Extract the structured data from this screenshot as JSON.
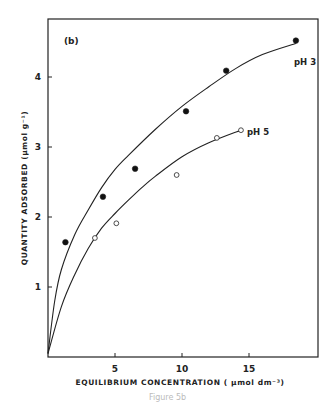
{
  "chart_data": {
    "type": "scatter",
    "panel_label": "(b)",
    "title": "",
    "xlabel": "EQUILIBRIUM CONCENTRATION ( µmol dm⁻³)",
    "ylabel": "QUANTITY ADSORBED (µmol g⁻¹)",
    "xlim": [
      0,
      20
    ],
    "ylim": [
      0,
      4.85
    ],
    "xticks": [
      5,
      10,
      15
    ],
    "yticks": [
      1,
      2,
      3,
      4
    ],
    "grid": false,
    "legend": "inline labels at curve ends",
    "series": [
      {
        "name": "pH 3",
        "marker": "filled-circle",
        "points": [
          [
            1.3,
            1.64
          ],
          [
            4.1,
            2.29
          ],
          [
            6.5,
            2.69
          ],
          [
            10.3,
            3.51
          ],
          [
            13.3,
            4.09
          ],
          [
            18.5,
            4.52
          ]
        ],
        "fit_curve": [
          [
            0,
            0.05
          ],
          [
            0.5,
            0.8
          ],
          [
            1,
            1.25
          ],
          [
            2,
            1.75
          ],
          [
            3,
            2.1
          ],
          [
            4,
            2.42
          ],
          [
            5,
            2.68
          ],
          [
            6,
            2.88
          ],
          [
            8,
            3.25
          ],
          [
            10,
            3.58
          ],
          [
            12,
            3.86
          ],
          [
            14,
            4.12
          ],
          [
            16,
            4.32
          ],
          [
            18.5,
            4.48
          ]
        ]
      },
      {
        "name": "pH 5",
        "marker": "open-circle",
        "points": [
          [
            3.5,
            1.7
          ],
          [
            5.1,
            1.91
          ],
          [
            9.6,
            2.6
          ],
          [
            12.6,
            3.13
          ],
          [
            14.4,
            3.24
          ]
        ],
        "fit_curve": [
          [
            0,
            0.05
          ],
          [
            1,
            0.72
          ],
          [
            2,
            1.18
          ],
          [
            3,
            1.55
          ],
          [
            4,
            1.84
          ],
          [
            5,
            2.05
          ],
          [
            6,
            2.24
          ],
          [
            7,
            2.42
          ],
          [
            8,
            2.58
          ],
          [
            10,
            2.86
          ],
          [
            12,
            3.06
          ],
          [
            14.4,
            3.24
          ]
        ]
      }
    ]
  },
  "caption": "Figure 5b"
}
